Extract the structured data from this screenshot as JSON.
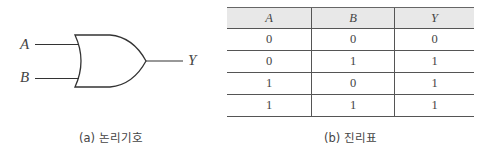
{
  "logic_symbol": {
    "inputs": [
      "A",
      "B"
    ],
    "output": "Y",
    "gate_type": "or-gate",
    "caption": "(a) 논리기호"
  },
  "truth_table": {
    "headers": [
      "A",
      "B",
      "Y"
    ],
    "rows": [
      [
        "0",
        "0",
        "0"
      ],
      [
        "0",
        "1",
        "1"
      ],
      [
        "1",
        "0",
        "1"
      ],
      [
        "1",
        "1",
        "1"
      ]
    ],
    "caption": "(b) 진리표",
    "header_bg": "#e8e8e8"
  }
}
